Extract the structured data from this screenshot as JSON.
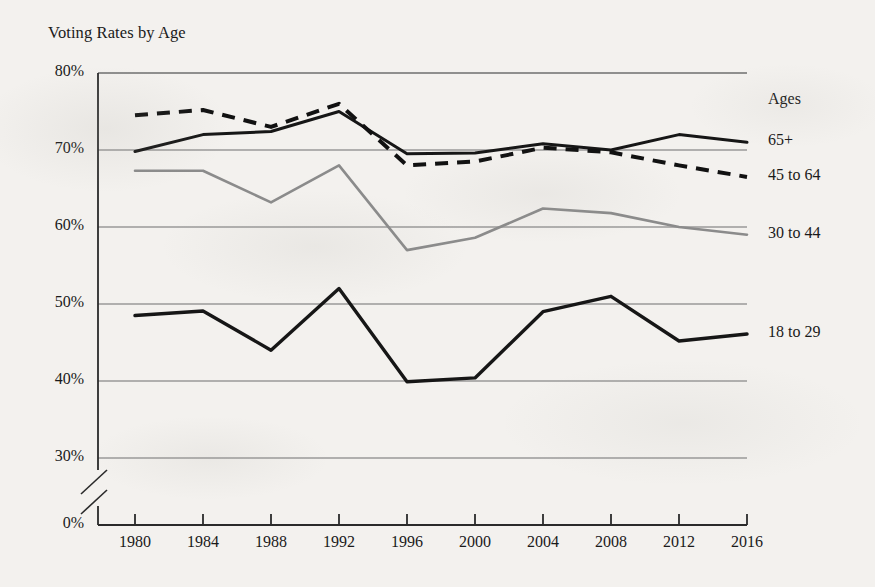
{
  "chart_data": {
    "type": "line",
    "title": "Voting Rates by Age",
    "xlabel": "",
    "ylabel": "",
    "x": [
      1980,
      1984,
      1988,
      1992,
      1996,
      2000,
      2004,
      2008,
      2012,
      2016
    ],
    "x_tick_labels": [
      "1980",
      "1984",
      "1988",
      "1992",
      "1996",
      "2000",
      "2004",
      "2008",
      "2012",
      "2016"
    ],
    "y_tick_labels": [
      "0%",
      "30%",
      "40%",
      "50%",
      "60%",
      "70%",
      "80%"
    ],
    "y_tick_values": [
      0,
      30,
      40,
      50,
      60,
      70,
      80
    ],
    "ylim": [
      30,
      80
    ],
    "axis_break": true,
    "grid": true,
    "legend_position": "right",
    "legend_title": "Ages",
    "series": [
      {
        "name": "65+",
        "label": "65+",
        "style": "solid",
        "color": "#161616",
        "width": 3.0,
        "values": [
          69.8,
          72.0,
          72.4,
          75.0,
          69.5,
          69.6,
          70.8,
          70.0,
          72.0,
          71.0
        ]
      },
      {
        "name": "45 to 64",
        "label": "45 to 64",
        "style": "dashed",
        "color": "#111111",
        "width": 4.0,
        "values": [
          74.5,
          75.2,
          73.0,
          76.0,
          68.0,
          68.5,
          70.3,
          69.7,
          68.0,
          66.5
        ]
      },
      {
        "name": "30 to 44",
        "label": "30 to 44",
        "style": "solid",
        "color": "#8b8b8b",
        "width": 2.6,
        "values": [
          67.3,
          67.3,
          63.2,
          68.0,
          57.0,
          58.6,
          62.4,
          61.8,
          60.0,
          59.0
        ]
      },
      {
        "name": "18 to 29",
        "label": "18 to 29",
        "style": "solid",
        "color": "#161616",
        "width": 3.4,
        "values": [
          48.5,
          49.1,
          44.0,
          52.0,
          39.9,
          40.4,
          49.0,
          51.0,
          45.2,
          46.1
        ]
      }
    ]
  },
  "colors": {
    "background": "#f3f1ee",
    "axis": "#2a2a2a",
    "gridline": "#6e6e6e",
    "text": "#1a1a1a"
  }
}
